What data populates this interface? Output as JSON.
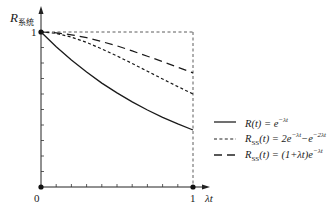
{
  "chart_data": {
    "type": "line",
    "title": "",
    "ylabel": "R系统",
    "ylabel_main": "R",
    "ylabel_sub": "系统",
    "xlabel": "λt",
    "xlim": [
      0,
      1
    ],
    "ylim": [
      0,
      1
    ],
    "x_ticks_labeled": [
      "0",
      "1"
    ],
    "y_ticks_labeled": [
      "1"
    ],
    "x_minor_ticks": 9,
    "y_minor_ticks": 9,
    "grid": false,
    "reference_lines": [
      {
        "type": "horizontal",
        "y": 1,
        "style": "dashed"
      },
      {
        "type": "vertical",
        "x": 1,
        "style": "dashed"
      }
    ],
    "x": [
      0,
      0.1,
      0.2,
      0.3,
      0.4,
      0.5,
      0.6,
      0.7,
      0.8,
      0.9,
      1.0
    ],
    "series": [
      {
        "name": "R(t) = e^-λt",
        "style": "solid",
        "values": [
          1.0,
          0.905,
          0.819,
          0.741,
          0.67,
          0.607,
          0.549,
          0.497,
          0.449,
          0.407,
          0.368
        ]
      },
      {
        "name": "R_SS(t) = 2e^-λt − e^-2λt",
        "style": "short-dash",
        "values": [
          1.0,
          0.991,
          0.967,
          0.933,
          0.891,
          0.845,
          0.797,
          0.747,
          0.697,
          0.648,
          0.6
        ]
      },
      {
        "name": "R_SS(t) = (1+λt)e^-λt",
        "style": "long-dash",
        "values": [
          1.0,
          0.995,
          0.982,
          0.963,
          0.938,
          0.91,
          0.878,
          0.844,
          0.809,
          0.772,
          0.736
        ]
      }
    ],
    "legend_position": "right"
  },
  "axis": {
    "y_main": "R",
    "y_sub": "系统",
    "x_label": "λt",
    "origin_label": "0",
    "x_end_label": "1",
    "y_top_label": "1"
  },
  "legend": {
    "items": [
      {
        "main": "R(t) = e",
        "sup": "−λt",
        "style": "solid"
      },
      {
        "main": "R",
        "sub": "SS",
        "rest": "(t) = 2e",
        "sup1": "−λt",
        "mid": "−e",
        "sup2": "−2λt",
        "style": "short-dash"
      },
      {
        "main": "R",
        "sub": "SS",
        "rest": "(t) = (1+λt)e",
        "sup": "−λt",
        "style": "long-dash"
      }
    ]
  }
}
